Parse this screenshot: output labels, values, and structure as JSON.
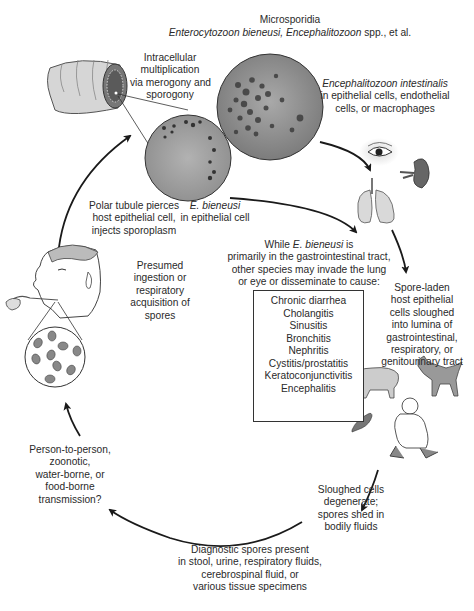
{
  "title": {
    "line1": "Microsporidia",
    "line2_italic_a": "Enterocytozoon bieneusi, Encephalitozoon",
    "line2_rest": " spp., et al."
  },
  "labels": {
    "intracellular": [
      "Intracellular",
      "multiplication",
      "via merogony and",
      "sporogony"
    ],
    "e_intestinalis": {
      "species": "Encephalitozoon intestinalis",
      "lines": [
        "in epithelial cells, endothelial",
        "cells, or macrophages"
      ]
    },
    "e_bieneusi": {
      "species": "E. bieneusi",
      "line": "in epithelial cell"
    },
    "polar_tubule": [
      "Polar tubule pierces",
      "host epithelial cell,",
      "injects sporoplasm"
    ],
    "presumed": [
      "Presumed",
      "ingestion or",
      "respiratory",
      "acquisition of",
      "spores"
    ],
    "while": {
      "prefix": "While ",
      "species": "E. bieneusi",
      "suffix": " is",
      "lines": [
        "primarily in the gastrointestinal tract,",
        "other species may invade the lung",
        "or eye or disseminate to cause:"
      ]
    },
    "spore_laden": [
      "Spore-laden",
      "host epithelial",
      "cells sloughed",
      "into lumina of",
      "gastrointestinal,",
      "respiratory, or",
      "genitourinary tract"
    ],
    "person_to_person": [
      "Person-to-person,",
      "zoonotic,",
      "water-borne, or",
      "food-borne",
      "transmission?"
    ],
    "sloughed": [
      "Sloughed cells",
      "degenerate;",
      "spores shed in",
      "bodily fluids"
    ],
    "diagnostic": [
      "Diagnostic spores present",
      "in stool, urine, respiratory fluids,",
      "cerebrospinal fluid, or",
      "various tissue specimens"
    ]
  },
  "diseases": [
    "Chronic diarrhea",
    "Cholangitis",
    "Sinusitis",
    "Bronchitis",
    "Nephritis",
    "Cystitis/prostatitis",
    "Keratoconjunctivitis",
    "Encephalitis"
  ],
  "illustrations": [
    "intestine-tube",
    "micrograph-e-intestinalis",
    "micrograph-e-bieneusi",
    "eye",
    "kidney",
    "lungs",
    "human-head-eating",
    "spores-magnified",
    "pig",
    "dog",
    "pigeon",
    "crouching-man"
  ],
  "colors": {
    "text": "#2a2a2a",
    "arrow": "#1a1a1a",
    "micrograph": "#8a8a8a"
  }
}
